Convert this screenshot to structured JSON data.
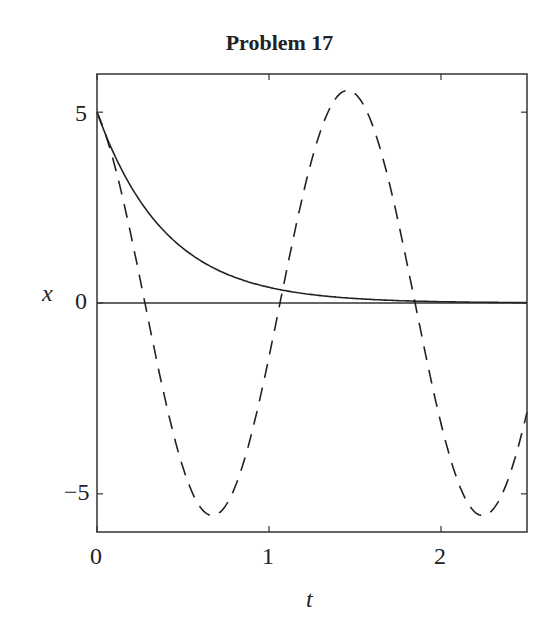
{
  "chart_data": {
    "type": "line",
    "title": "Problem 17",
    "xlabel": "t",
    "ylabel": "x",
    "xlim": [
      0,
      2.5
    ],
    "ylim": [
      -6,
      6
    ],
    "xticks": [
      0,
      1,
      2
    ],
    "xtick_labels": [
      "0",
      "1",
      "2"
    ],
    "yticks": [
      5,
      0,
      -5
    ],
    "ytick_labels": [
      "5",
      "0",
      "−5"
    ],
    "grid": false,
    "legend": null,
    "zero_line": true,
    "series": [
      {
        "name": "solid",
        "style": "solid",
        "color": "#222222",
        "description": "exponential decay from 5 toward 0",
        "x": [
          0,
          0.25,
          0.366,
          0.6,
          0.8,
          1.0,
          1.18,
          1.5,
          2.0,
          2.5
        ],
        "y": [
          5.0,
          2.8,
          2.06,
          1.0,
          0.68,
          0.41,
          0.18,
          0.12,
          0.03,
          0.01
        ]
      },
      {
        "name": "dashed",
        "style": "dashed",
        "color": "#222222",
        "description": "sinusoidal oscillation, amplitude ~5.6, period ~1.57",
        "x": [
          0,
          0.28,
          0.67,
          1.06,
          1.45,
          1.85,
          2.25,
          2.5
        ],
        "y": [
          5.0,
          0.0,
          -5.57,
          0.0,
          5.57,
          0.0,
          -5.57,
          -2.9
        ]
      }
    ]
  }
}
